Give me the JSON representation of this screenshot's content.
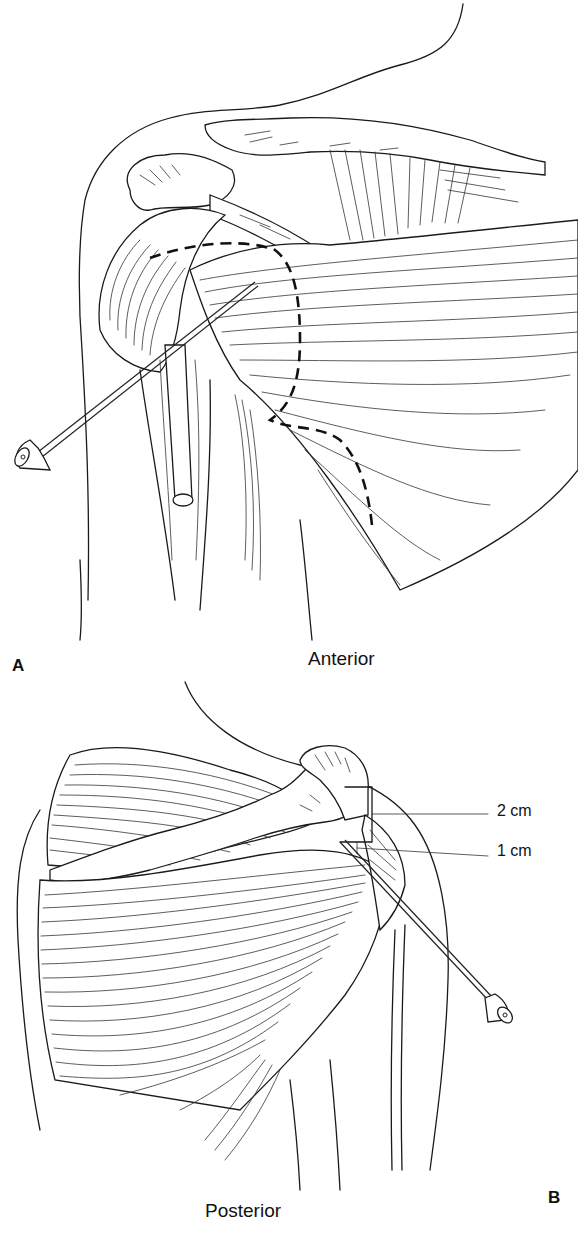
{
  "figure": {
    "panels": [
      {
        "id": "A",
        "letter": "A",
        "view_label": "Anterior",
        "elements": [
          "body-outline",
          "clavicle",
          "acromion",
          "coracoid-process",
          "deltoid-muscle",
          "pectoralis-muscle",
          "biceps-tendon",
          "humerus",
          "injection-needle",
          "dashed-injection-boundary"
        ]
      },
      {
        "id": "B",
        "letter": "B",
        "view_label": "Posterior",
        "elements": [
          "body-outline",
          "scapular-spine",
          "acromion",
          "supraspinatus-muscle",
          "infraspinatus-muscle",
          "deltoid-muscle",
          "humerus",
          "injection-needle",
          "measurement-bracket"
        ],
        "measurements": [
          {
            "label": "2 cm"
          },
          {
            "label": "1 cm"
          }
        ]
      }
    ],
    "colors": {
      "line": "#1a1a1a",
      "background": "#ffffff"
    }
  }
}
